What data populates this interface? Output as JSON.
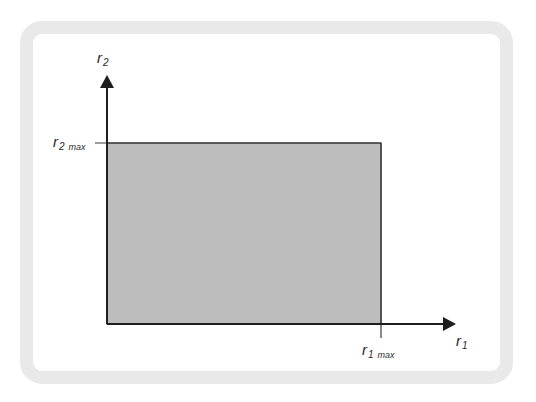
{
  "diagram": {
    "type": "feasible-region",
    "colors": {
      "frame": "#e9e9e9",
      "region_fill": "#bdbdbd",
      "axis": "#1e1e1e",
      "background": "#ffffff"
    },
    "axes": {
      "x": {
        "symbol": "r",
        "subscript": "1"
      },
      "y": {
        "symbol": "r",
        "subscript": "2"
      }
    },
    "limits": {
      "x_max": {
        "symbol": "r",
        "subscript": "1",
        "qualifier": "max"
      },
      "y_max": {
        "symbol": "r",
        "subscript": "2",
        "qualifier": "max"
      }
    },
    "region": {
      "description": "shaded rectangle from origin to (r1 max, r2 max)"
    }
  }
}
